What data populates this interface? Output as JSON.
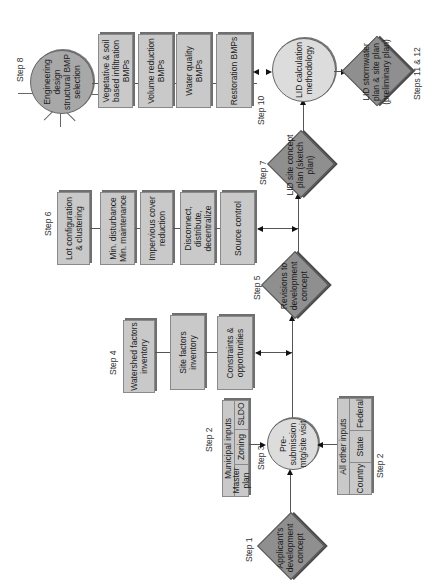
{
  "diagram": {
    "orientation": "rotated 90 degrees counter-clockwise",
    "colors": {
      "box_fill": "#c9c9c9",
      "diamond_fill": "#8f8f8f",
      "circle_light": "#dcdcdc",
      "circle_mid": "#a8a8a8",
      "line": "#555555"
    },
    "steps": {
      "step1": {
        "label": "Step 1",
        "node": "Applicant's development concept"
      },
      "step2_municipal": {
        "label": "Step 2",
        "header": "Municipal inputs",
        "cells": [
          "Master plan",
          "Zoning",
          "SLDO"
        ]
      },
      "step2_other": {
        "label": "Step 2",
        "header": "All other inputs",
        "cells": [
          "Country",
          "State",
          "Federal"
        ]
      },
      "step3": {
        "label": "Step 3",
        "node": "Pre-submission mtg/site visit"
      },
      "step4": {
        "label": "Step 4",
        "boxes": [
          "Watershed factors inventory",
          "Site factors inventory",
          "Constraints & opportunities"
        ]
      },
      "step5": {
        "label": "Step 5",
        "node": "Revisions to development concept"
      },
      "step6": {
        "label": "Step 6",
        "boxes": [
          "Lot configuration & clustering",
          "Min. disturbance Min. maintenance",
          "Impervious cover reduction",
          "Disconnect, distribute, decentralize",
          "Source control"
        ]
      },
      "step7": {
        "label": "Step 7",
        "node": "LID site concept plan (sketch plan)"
      },
      "step8": {
        "label": "Step 8",
        "node": "Engineering design structural BMP selection",
        "boxes": [
          "Vegetative & soil based infiltration BMPs",
          "Volume reduction BMPs",
          "Water quality BMPs",
          "Restoration BMPs"
        ]
      },
      "step10": {
        "label": "Step 10",
        "node": "LID calculation methodology"
      },
      "step11_12": {
        "label": "Steps 11 & 12",
        "node": "LID stormwater plan & site plan (preliminary plan)"
      }
    }
  }
}
